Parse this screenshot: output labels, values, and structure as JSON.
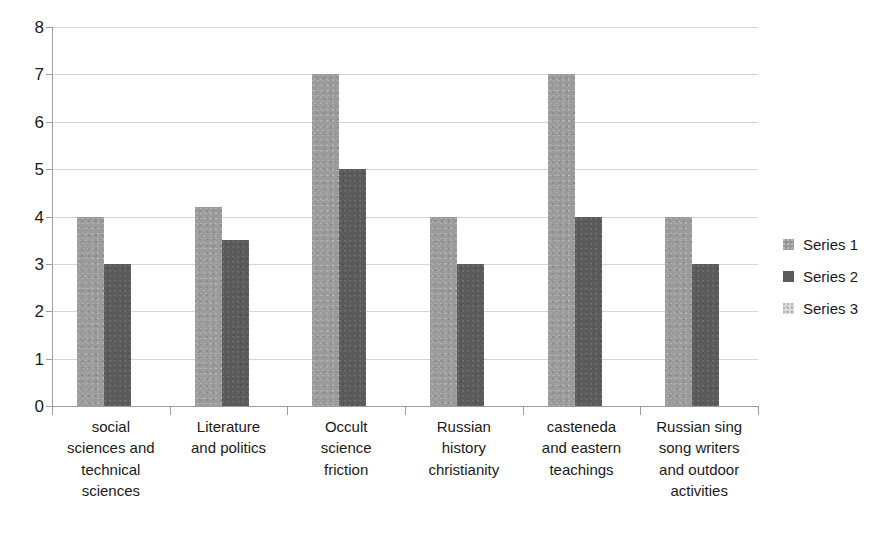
{
  "chart_data": {
    "type": "bar",
    "title": "",
    "subtitle": "",
    "xlabel": "",
    "ylabel": "",
    "ylim": [
      0,
      8
    ],
    "ytick_labels": [
      "8",
      "7",
      "6",
      "5",
      "4",
      "3",
      "2",
      "1",
      "0"
    ],
    "ytick_values": [
      8,
      7,
      6,
      5,
      4,
      3,
      2,
      1,
      0
    ],
    "grid": true,
    "legend_position": "right",
    "categories": [
      "social sciences and technical sciences",
      "Literature and politics",
      "Occult science friction",
      "Russian history christianity",
      "casteneda and eastern teachings",
      "Russian sing song writers and outdoor activities"
    ],
    "category_label_lines": [
      [
        "social",
        "sciences and",
        "technical",
        "sciences"
      ],
      [
        "Literature",
        "and politics"
      ],
      [
        "Occult",
        "science",
        "friction"
      ],
      [
        "Russian",
        "history",
        "christianity"
      ],
      [
        "casteneda",
        "and eastern",
        "teachings"
      ],
      [
        "Russian sing",
        "song writers",
        "and outdoor",
        "activities"
      ]
    ],
    "series": [
      {
        "name": "Series 1",
        "color": "#9b9b9b",
        "values": [
          4,
          4.2,
          7,
          4,
          7,
          4
        ]
      },
      {
        "name": "Series 2",
        "color": "#5b5b5b",
        "values": [
          3,
          3.5,
          5,
          3,
          4,
          3
        ]
      },
      {
        "name": "Series 3",
        "color": "#d9d9d9",
        "values": [
          0,
          0,
          0,
          0,
          0,
          0
        ]
      }
    ]
  },
  "legend": {
    "items": [
      {
        "label": "Series 1",
        "swatch_class": "s1"
      },
      {
        "label": "Series 2",
        "swatch_class": "s2"
      },
      {
        "label": "Series 3",
        "swatch_class": "s3"
      }
    ]
  },
  "colors": {
    "background": "#ffffff",
    "gridline": "#d6d6d6",
    "axis": "#9d9d9d",
    "text": "#1a1a1a",
    "series_1": "#9b9b9b",
    "series_2": "#5b5b5b",
    "series_3": "#d9d9d9"
  }
}
